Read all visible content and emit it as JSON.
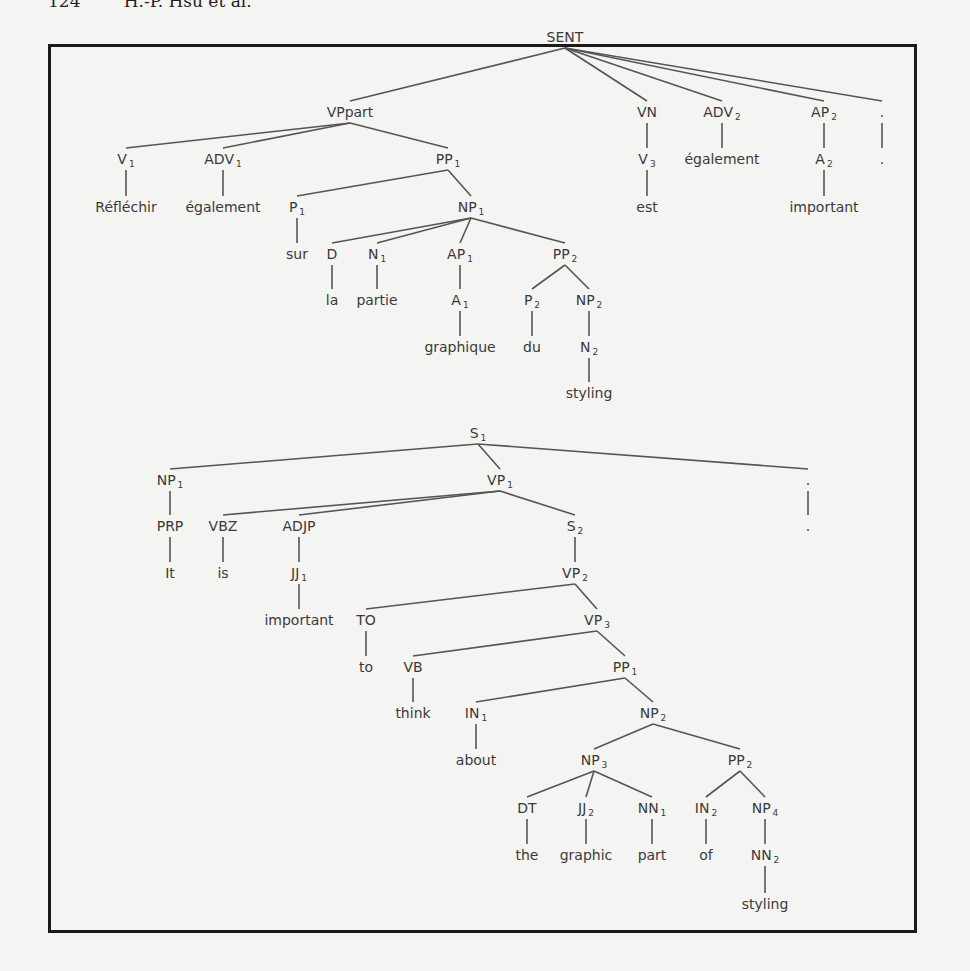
{
  "header": {
    "text": "124        H.-P. Hsu et al."
  },
  "trees": [
    {
      "name": "french-parse-tree",
      "nodes": [
        {
          "id": "SENT",
          "label": "SENT",
          "sub": "",
          "x": 565,
          "y": 42,
          "parent": null
        },
        {
          "id": "VPpart",
          "label": "VPpart",
          "sub": "",
          "x": 350,
          "y": 117,
          "parent": "SENT"
        },
        {
          "id": "VN",
          "label": "VN",
          "sub": "",
          "x": 647,
          "y": 117,
          "parent": "SENT"
        },
        {
          "id": "ADV2",
          "label": "ADV",
          "sub": "2",
          "x": 722,
          "y": 117,
          "parent": "SENT"
        },
        {
          "id": "AP2",
          "label": "AP",
          "sub": "2",
          "x": 824,
          "y": 117,
          "parent": "SENT"
        },
        {
          "id": "PUNCT1",
          "label": ".",
          "sub": "",
          "x": 882,
          "y": 117,
          "parent": "SENT"
        },
        {
          "id": "V1",
          "label": "V",
          "sub": "1",
          "x": 126,
          "y": 164,
          "parent": "VPpart"
        },
        {
          "id": "ADV1",
          "label": "ADV",
          "sub": "1",
          "x": 223,
          "y": 164,
          "parent": "VPpart"
        },
        {
          "id": "PP1f",
          "label": "PP",
          "sub": "1",
          "x": 448,
          "y": 164,
          "parent": "VPpart"
        },
        {
          "id": "V3",
          "label": "V",
          "sub": "3",
          "x": 647,
          "y": 164,
          "parent": "VN"
        },
        {
          "id": "egalement2",
          "label": "également",
          "sub": "",
          "x": 722,
          "y": 164,
          "parent": "ADV2",
          "leaf": true
        },
        {
          "id": "A2",
          "label": "A",
          "sub": "2",
          "x": 824,
          "y": 164,
          "parent": "AP2"
        },
        {
          "id": "PUNCT1w",
          "label": ".",
          "sub": "",
          "x": 882,
          "y": 164,
          "parent": "PUNCT1",
          "leaf": true
        },
        {
          "id": "Reflechir",
          "label": "Réfléchir",
          "sub": "",
          "x": 126,
          "y": 212,
          "parent": "V1",
          "leaf": true
        },
        {
          "id": "egalement1",
          "label": "également",
          "sub": "",
          "x": 223,
          "y": 212,
          "parent": "ADV1",
          "leaf": true
        },
        {
          "id": "P1",
          "label": "P",
          "sub": "1",
          "x": 297,
          "y": 212,
          "parent": "PP1f"
        },
        {
          "id": "NP1f",
          "label": "NP",
          "sub": "1",
          "x": 471,
          "y": 212,
          "parent": "PP1f"
        },
        {
          "id": "est",
          "label": "est",
          "sub": "",
          "x": 647,
          "y": 212,
          "parent": "V3",
          "leaf": true
        },
        {
          "id": "important_f",
          "label": "important",
          "sub": "",
          "x": 824,
          "y": 212,
          "parent": "A2",
          "leaf": true
        },
        {
          "id": "sur",
          "label": "sur",
          "sub": "",
          "x": 297,
          "y": 259,
          "parent": "P1",
          "leaf": true
        },
        {
          "id": "D",
          "label": "D",
          "sub": "",
          "x": 332,
          "y": 259,
          "parent": "NP1f"
        },
        {
          "id": "N1",
          "label": "N",
          "sub": "1",
          "x": 377,
          "y": 259,
          "parent": "NP1f"
        },
        {
          "id": "AP1",
          "label": "AP",
          "sub": "1",
          "x": 460,
          "y": 259,
          "parent": "NP1f"
        },
        {
          "id": "PP2f",
          "label": "PP",
          "sub": "2",
          "x": 565,
          "y": 259,
          "parent": "NP1f"
        },
        {
          "id": "la",
          "label": "la",
          "sub": "",
          "x": 332,
          "y": 305,
          "parent": "D",
          "leaf": true
        },
        {
          "id": "partie",
          "label": "partie",
          "sub": "",
          "x": 377,
          "y": 305,
          "parent": "N1",
          "leaf": true
        },
        {
          "id": "A1",
          "label": "A",
          "sub": "1",
          "x": 460,
          "y": 305,
          "parent": "AP1"
        },
        {
          "id": "P2",
          "label": "P",
          "sub": "2",
          "x": 532,
          "y": 305,
          "parent": "PP2f"
        },
        {
          "id": "NP2f",
          "label": "NP",
          "sub": "2",
          "x": 589,
          "y": 305,
          "parent": "PP2f"
        },
        {
          "id": "graphique",
          "label": "graphique",
          "sub": "",
          "x": 460,
          "y": 352,
          "parent": "A1",
          "leaf": true
        },
        {
          "id": "du",
          "label": "du",
          "sub": "",
          "x": 532,
          "y": 352,
          "parent": "P2",
          "leaf": true
        },
        {
          "id": "N2",
          "label": "N",
          "sub": "2",
          "x": 589,
          "y": 352,
          "parent": "NP2f"
        },
        {
          "id": "styling_f",
          "label": "styling",
          "sub": "",
          "x": 589,
          "y": 398,
          "parent": "N2",
          "leaf": true
        }
      ]
    },
    {
      "name": "english-parse-tree",
      "nodes": [
        {
          "id": "S1",
          "label": "S",
          "sub": "1",
          "x": 478,
          "y": 438,
          "parent": null
        },
        {
          "id": "NP1e",
          "label": "NP",
          "sub": "1",
          "x": 170,
          "y": 485,
          "parent": "S1"
        },
        {
          "id": "VP1",
          "label": "VP",
          "sub": "1",
          "x": 500,
          "y": 485,
          "parent": "S1"
        },
        {
          "id": "PUNCT2",
          "label": ".",
          "sub": "",
          "x": 808,
          "y": 485,
          "parent": "S1"
        },
        {
          "id": "PRP",
          "label": "PRP",
          "sub": "",
          "x": 170,
          "y": 531,
          "parent": "NP1e"
        },
        {
          "id": "VBZ",
          "label": "VBZ",
          "sub": "",
          "x": 223,
          "y": 531,
          "parent": "VP1"
        },
        {
          "id": "ADJP",
          "label": "ADJP",
          "sub": "",
          "x": 299,
          "y": 531,
          "parent": "VP1"
        },
        {
          "id": "S2",
          "label": "S",
          "sub": "2",
          "x": 575,
          "y": 531,
          "parent": "VP1"
        },
        {
          "id": "PUNCT2w",
          "label": ".",
          "sub": "",
          "x": 808,
          "y": 531,
          "parent": "PUNCT2",
          "leaf": true
        },
        {
          "id": "It",
          "label": "It",
          "sub": "",
          "x": 170,
          "y": 578,
          "parent": "PRP",
          "leaf": true
        },
        {
          "id": "is",
          "label": "is",
          "sub": "",
          "x": 223,
          "y": 578,
          "parent": "VBZ",
          "leaf": true
        },
        {
          "id": "JJ1",
          "label": "JJ",
          "sub": "1",
          "x": 299,
          "y": 578,
          "parent": "ADJP"
        },
        {
          "id": "VP2",
          "label": "VP",
          "sub": "2",
          "x": 575,
          "y": 578,
          "parent": "S2"
        },
        {
          "id": "important_e",
          "label": "important",
          "sub": "",
          "x": 299,
          "y": 625,
          "parent": "JJ1",
          "leaf": true
        },
        {
          "id": "TO",
          "label": "TO",
          "sub": "",
          "x": 366,
          "y": 625,
          "parent": "VP2"
        },
        {
          "id": "VP3",
          "label": "VP",
          "sub": "3",
          "x": 597,
          "y": 625,
          "parent": "VP2"
        },
        {
          "id": "to",
          "label": "to",
          "sub": "",
          "x": 366,
          "y": 672,
          "parent": "TO",
          "leaf": true
        },
        {
          "id": "VB",
          "label": "VB",
          "sub": "",
          "x": 413,
          "y": 672,
          "parent": "VP3"
        },
        {
          "id": "PP1e",
          "label": "PP",
          "sub": "1",
          "x": 625,
          "y": 672,
          "parent": "VP3"
        },
        {
          "id": "think",
          "label": "think",
          "sub": "",
          "x": 413,
          "y": 718,
          "parent": "VB",
          "leaf": true
        },
        {
          "id": "IN1",
          "label": "IN",
          "sub": "1",
          "x": 476,
          "y": 718,
          "parent": "PP1e"
        },
        {
          "id": "NP2e",
          "label": "NP",
          "sub": "2",
          "x": 653,
          "y": 718,
          "parent": "PP1e"
        },
        {
          "id": "about",
          "label": "about",
          "sub": "",
          "x": 476,
          "y": 765,
          "parent": "IN1",
          "leaf": true
        },
        {
          "id": "NP3",
          "label": "NP",
          "sub": "3",
          "x": 594,
          "y": 765,
          "parent": "NP2e"
        },
        {
          "id": "PP2e",
          "label": "PP",
          "sub": "2",
          "x": 740,
          "y": 765,
          "parent": "NP2e"
        },
        {
          "id": "DT",
          "label": "DT",
          "sub": "",
          "x": 527,
          "y": 813,
          "parent": "NP3"
        },
        {
          "id": "JJ2",
          "label": "JJ",
          "sub": "2",
          "x": 586,
          "y": 813,
          "parent": "NP3"
        },
        {
          "id": "NN1",
          "label": "NN",
          "sub": "1",
          "x": 652,
          "y": 813,
          "parent": "NP3"
        },
        {
          "id": "IN2",
          "label": "IN",
          "sub": "2",
          "x": 706,
          "y": 813,
          "parent": "PP2e"
        },
        {
          "id": "NP4",
          "label": "NP",
          "sub": "4",
          "x": 765,
          "y": 813,
          "parent": "PP2e"
        },
        {
          "id": "the",
          "label": "the",
          "sub": "",
          "x": 527,
          "y": 860,
          "parent": "DT",
          "leaf": true
        },
        {
          "id": "graphic",
          "label": "graphic",
          "sub": "",
          "x": 586,
          "y": 860,
          "parent": "JJ2",
          "leaf": true
        },
        {
          "id": "part",
          "label": "part",
          "sub": "",
          "x": 652,
          "y": 860,
          "parent": "NN1",
          "leaf": true
        },
        {
          "id": "of",
          "label": "of",
          "sub": "",
          "x": 706,
          "y": 860,
          "parent": "IN2",
          "leaf": true
        },
        {
          "id": "NN2",
          "label": "NN",
          "sub": "2",
          "x": 765,
          "y": 860,
          "parent": "NP4"
        },
        {
          "id": "styling_e",
          "label": "styling",
          "sub": "",
          "x": 765,
          "y": 909,
          "parent": "NN2",
          "leaf": true
        }
      ]
    }
  ]
}
